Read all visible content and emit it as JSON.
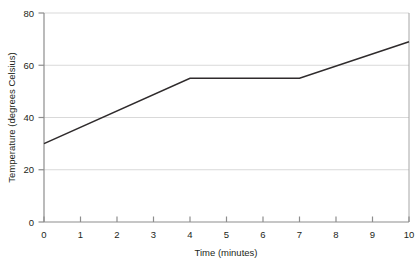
{
  "chart_data": {
    "type": "line",
    "title": "",
    "xlabel": "Time (minutes)",
    "ylabel": "Temperature (degrees Celsius)",
    "x": [
      0,
      1,
      2,
      3,
      4,
      5,
      6,
      7,
      8,
      9,
      10
    ],
    "series": [
      {
        "name": "Temperature",
        "values": [
          30.0,
          36.25,
          42.5,
          48.75,
          55.0,
          55.0,
          55.0,
          55.0,
          59.67,
          64.33,
          69.0
        ],
        "color": "#2f2b2c"
      }
    ],
    "vertices": [
      {
        "x": 0,
        "y": 30
      },
      {
        "x": 4,
        "y": 55
      },
      {
        "x": 7,
        "y": 55
      },
      {
        "x": 10,
        "y": 69
      }
    ],
    "xlim": [
      0,
      10
    ],
    "ylim": [
      0,
      80
    ],
    "xticks": [
      "0",
      "1",
      "2",
      "3",
      "4",
      "5",
      "6",
      "7",
      "8",
      "9",
      "10"
    ],
    "yticks": [
      "0",
      "20",
      "40",
      "60",
      "80"
    ],
    "grid": "horizontal",
    "grid_color": "#d9d9d9",
    "axis_color": "#8d8d8d",
    "legend": "none",
    "marker": "none"
  },
  "axes": {
    "x_title": "Time (minutes)",
    "y_title": "Temperature (degrees Celsius)"
  }
}
